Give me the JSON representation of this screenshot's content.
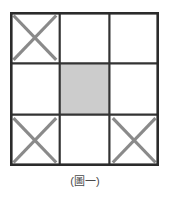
{
  "figure": {
    "caption": "(圖一)",
    "caption_label_text": "圖一",
    "grid": {
      "rows": 3,
      "cols": 3,
      "outer_border_color": "#2b2b2b",
      "inner_line_color": "#333333",
      "cross_mark_color": "#8a8a8a",
      "shaded_fill_color": "#cccccc",
      "empty_fill_color": "#ffffff",
      "cells": [
        {
          "row": 0,
          "col": 0,
          "name": "cell-top-left",
          "mark": "cross",
          "fill": "empty"
        },
        {
          "row": 0,
          "col": 1,
          "name": "cell-top-center",
          "mark": "none",
          "fill": "empty"
        },
        {
          "row": 0,
          "col": 2,
          "name": "cell-top-right",
          "mark": "none",
          "fill": "empty"
        },
        {
          "row": 1,
          "col": 0,
          "name": "cell-middle-left",
          "mark": "none",
          "fill": "empty"
        },
        {
          "row": 1,
          "col": 1,
          "name": "cell-center",
          "mark": "none",
          "fill": "shaded"
        },
        {
          "row": 1,
          "col": 2,
          "name": "cell-middle-right",
          "mark": "none",
          "fill": "empty"
        },
        {
          "row": 2,
          "col": 0,
          "name": "cell-bottom-left",
          "mark": "cross",
          "fill": "empty"
        },
        {
          "row": 2,
          "col": 1,
          "name": "cell-bottom-center",
          "mark": "none",
          "fill": "empty"
        },
        {
          "row": 2,
          "col": 2,
          "name": "cell-bottom-right",
          "mark": "cross",
          "fill": "empty"
        }
      ]
    }
  }
}
